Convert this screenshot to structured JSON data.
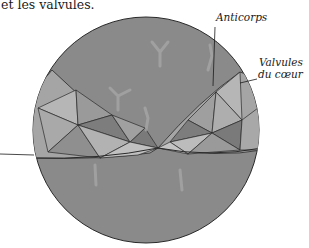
{
  "caption": {
    "text": "et les valvules."
  },
  "labels": {
    "anticorps": "Anticorps",
    "valvules_line1": "Valvules",
    "valvules_line2": "du cœur"
  },
  "colors": {
    "background": "#ffffff",
    "disc_fill": "#8a8a8a",
    "valve_light": "#b4b4b4",
    "valve_mid": "#9c9c9c",
    "valve_dark": "#7a7a7a",
    "outline": "#2a2a2a",
    "antibody": "#a8a8a8"
  }
}
